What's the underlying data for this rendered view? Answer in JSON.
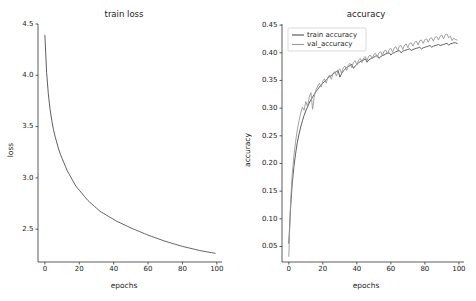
{
  "figure": {
    "width": 476,
    "height": 301,
    "background": "#ffffff"
  },
  "chart_data": [
    {
      "type": "line",
      "panel": "left",
      "title": "train loss",
      "xlabel": "epochs",
      "ylabel": "loss",
      "xlim": [
        -4,
        103
      ],
      "ylim": [
        2.18,
        4.5
      ],
      "xticks": [
        0,
        20,
        40,
        60,
        80,
        100
      ],
      "xticklabels": [
        "0",
        "20",
        "40",
        "60",
        "80",
        "100"
      ],
      "yticks": [
        2.5,
        3.0,
        3.5,
        4.0,
        4.5
      ],
      "yticklabels": [
        "2.5",
        "3.0",
        "3.5",
        "4.0",
        "4.5"
      ],
      "grid": false,
      "legend": null,
      "series": [
        {
          "name": "train loss",
          "color": "#4d4d4d",
          "x": [
            0,
            1,
            2,
            3,
            4,
            5,
            6,
            7,
            8,
            9,
            10,
            11,
            12,
            13,
            14,
            15,
            16,
            17,
            18,
            19,
            20,
            21,
            22,
            23,
            24,
            25,
            26,
            27,
            28,
            29,
            30,
            31,
            32,
            33,
            34,
            35,
            36,
            37,
            38,
            39,
            40,
            41,
            42,
            43,
            44,
            45,
            46,
            47,
            48,
            49,
            50,
            51,
            52,
            53,
            54,
            55,
            56,
            57,
            58,
            59,
            60,
            61,
            62,
            63,
            64,
            65,
            66,
            67,
            68,
            69,
            70,
            71,
            72,
            73,
            74,
            75,
            76,
            77,
            78,
            79,
            80,
            81,
            82,
            83,
            84,
            85,
            86,
            87,
            88,
            89,
            90,
            91,
            92,
            93,
            94,
            95,
            96,
            97,
            98,
            99
          ],
          "values": [
            4.39,
            4.03,
            3.82,
            3.67,
            3.56,
            3.47,
            3.4,
            3.34,
            3.28,
            3.23,
            3.19,
            3.15,
            3.11,
            3.07,
            3.04,
            3.01,
            2.98,
            2.95,
            2.92,
            2.9,
            2.88,
            2.86,
            2.84,
            2.82,
            2.8,
            2.78,
            2.765,
            2.75,
            2.735,
            2.72,
            2.705,
            2.69,
            2.675,
            2.665,
            2.655,
            2.645,
            2.635,
            2.625,
            2.615,
            2.605,
            2.595,
            2.585,
            2.575,
            2.568,
            2.56,
            2.552,
            2.544,
            2.536,
            2.528,
            2.52,
            2.512,
            2.505,
            2.498,
            2.491,
            2.484,
            2.477,
            2.47,
            2.463,
            2.456,
            2.449,
            2.442,
            2.436,
            2.43,
            2.424,
            2.418,
            2.412,
            2.406,
            2.4,
            2.394,
            2.388,
            2.382,
            2.377,
            2.372,
            2.367,
            2.362,
            2.357,
            2.352,
            2.347,
            2.342,
            2.337,
            2.332,
            2.328,
            2.324,
            2.32,
            2.316,
            2.312,
            2.308,
            2.304,
            2.3,
            2.296,
            2.292,
            2.289,
            2.286,
            2.283,
            2.28,
            2.277,
            2.274,
            2.271,
            2.268,
            2.265
          ]
        }
      ]
    },
    {
      "type": "line",
      "panel": "right",
      "title": "accuracy",
      "xlabel": "epochs",
      "ylabel": "accuracy",
      "xlim": [
        -4,
        103
      ],
      "ylim": [
        0.022,
        0.452
      ],
      "xticks": [
        0,
        20,
        40,
        60,
        80,
        100
      ],
      "xticklabels": [
        "0",
        "20",
        "40",
        "60",
        "80",
        "100"
      ],
      "yticks": [
        0.05,
        0.1,
        0.15,
        0.2,
        0.25,
        0.3,
        0.35,
        0.4,
        0.45
      ],
      "yticklabels": [
        "0.05",
        "0.10",
        "0.15",
        "0.20",
        "0.25",
        "0.30",
        "0.35",
        "0.40",
        "0.45"
      ],
      "grid": false,
      "legend": {
        "position": "upper left",
        "entries": [
          "train accuracy",
          "val_accuracy"
        ]
      },
      "series": [
        {
          "name": "train accuracy",
          "color": "#4d4d4d",
          "x": [
            0,
            1,
            2,
            3,
            4,
            5,
            6,
            7,
            8,
            9,
            10,
            11,
            12,
            13,
            14,
            15,
            16,
            17,
            18,
            19,
            20,
            21,
            22,
            23,
            24,
            25,
            26,
            27,
            28,
            29,
            30,
            31,
            32,
            33,
            34,
            35,
            36,
            37,
            38,
            39,
            40,
            41,
            42,
            43,
            44,
            45,
            46,
            47,
            48,
            49,
            50,
            51,
            52,
            53,
            54,
            55,
            56,
            57,
            58,
            59,
            60,
            61,
            62,
            63,
            64,
            65,
            66,
            67,
            68,
            69,
            70,
            71,
            72,
            73,
            74,
            75,
            76,
            77,
            78,
            79,
            80,
            81,
            82,
            83,
            84,
            85,
            86,
            87,
            88,
            89,
            90,
            91,
            92,
            93,
            94,
            95,
            96,
            97,
            98,
            99
          ],
          "values": [
            0.056,
            0.118,
            0.163,
            0.194,
            0.218,
            0.238,
            0.253,
            0.266,
            0.277,
            0.287,
            0.295,
            0.302,
            0.309,
            0.315,
            0.32,
            0.325,
            0.33,
            0.334,
            0.338,
            0.342,
            0.345,
            0.348,
            0.351,
            0.354,
            0.357,
            0.359,
            0.362,
            0.364,
            0.366,
            0.368,
            0.356,
            0.362,
            0.367,
            0.37,
            0.373,
            0.375,
            0.377,
            0.379,
            0.372,
            0.376,
            0.379,
            0.382,
            0.384,
            0.386,
            0.387,
            0.389,
            0.383,
            0.387,
            0.389,
            0.391,
            0.392,
            0.394,
            0.395,
            0.39,
            0.393,
            0.395,
            0.396,
            0.398,
            0.399,
            0.4,
            0.396,
            0.399,
            0.4,
            0.402,
            0.403,
            0.404,
            0.4,
            0.403,
            0.404,
            0.405,
            0.406,
            0.407,
            0.404,
            0.406,
            0.407,
            0.408,
            0.409,
            0.41,
            0.407,
            0.409,
            0.41,
            0.411,
            0.412,
            0.413,
            0.41,
            0.412,
            0.413,
            0.414,
            0.415,
            0.413,
            0.414,
            0.415,
            0.416,
            0.417,
            0.414,
            0.416,
            0.417,
            0.418,
            0.418,
            0.417
          ]
        },
        {
          "name": "val_accuracy",
          "color": "#999999",
          "x": [
            0,
            1,
            2,
            3,
            4,
            5,
            6,
            7,
            8,
            9,
            10,
            11,
            12,
            13,
            14,
            15,
            16,
            17,
            18,
            19,
            20,
            21,
            22,
            23,
            24,
            25,
            26,
            27,
            28,
            29,
            30,
            31,
            32,
            33,
            34,
            35,
            36,
            37,
            38,
            39,
            40,
            41,
            42,
            43,
            44,
            45,
            46,
            47,
            48,
            49,
            50,
            51,
            52,
            53,
            54,
            55,
            56,
            57,
            58,
            59,
            60,
            61,
            62,
            63,
            64,
            65,
            66,
            67,
            68,
            69,
            70,
            71,
            72,
            73,
            74,
            75,
            76,
            77,
            78,
            79,
            80,
            81,
            82,
            83,
            84,
            85,
            86,
            87,
            88,
            89,
            90,
            91,
            92,
            93,
            94,
            95,
            96,
            97,
            98,
            99
          ],
          "values": [
            0.032,
            0.128,
            0.18,
            0.214,
            0.24,
            0.261,
            0.277,
            0.291,
            0.302,
            0.296,
            0.312,
            0.303,
            0.32,
            0.328,
            0.298,
            0.322,
            0.333,
            0.34,
            0.345,
            0.338,
            0.349,
            0.353,
            0.345,
            0.356,
            0.36,
            0.352,
            0.362,
            0.366,
            0.358,
            0.368,
            0.371,
            0.363,
            0.373,
            0.376,
            0.368,
            0.378,
            0.381,
            0.373,
            0.383,
            0.386,
            0.378,
            0.387,
            0.39,
            0.382,
            0.391,
            0.393,
            0.386,
            0.394,
            0.396,
            0.389,
            0.397,
            0.399,
            0.392,
            0.4,
            0.402,
            0.395,
            0.403,
            0.405,
            0.398,
            0.406,
            0.408,
            0.401,
            0.409,
            0.411,
            0.404,
            0.412,
            0.413,
            0.406,
            0.414,
            0.416,
            0.409,
            0.417,
            0.418,
            0.412,
            0.419,
            0.421,
            0.414,
            0.422,
            0.423,
            0.417,
            0.424,
            0.425,
            0.419,
            0.426,
            0.427,
            0.421,
            0.428,
            0.429,
            0.423,
            0.43,
            0.432,
            0.425,
            0.433,
            0.434,
            0.427,
            0.43,
            0.422,
            0.426,
            0.424,
            0.423
          ]
        }
      ]
    }
  ]
}
